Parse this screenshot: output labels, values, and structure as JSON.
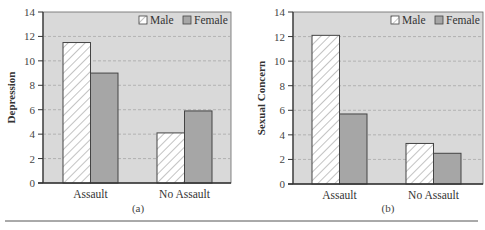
{
  "chart_data": [
    {
      "type": "bar",
      "panel": "(a)",
      "title": "",
      "xlabel": "",
      "ylabel": "Depression",
      "categories": [
        "Assault",
        "No Assault"
      ],
      "series": [
        {
          "name": "Male",
          "values": [
            11.5,
            4.1
          ],
          "pattern": "hatched",
          "color": "#ffffff"
        },
        {
          "name": "Female",
          "values": [
            9.0,
            5.9
          ],
          "pattern": "solid",
          "color": "#a6a6a6"
        }
      ],
      "ylim": [
        0,
        14
      ],
      "yticks": [
        0,
        2,
        4,
        6,
        8,
        10,
        12,
        14
      ],
      "grid": true,
      "legend_position": "top-right"
    },
    {
      "type": "bar",
      "panel": "(b)",
      "title": "",
      "xlabel": "",
      "ylabel": "Sexual Concern",
      "categories": [
        "Assault",
        "No Assault"
      ],
      "series": [
        {
          "name": "Male",
          "values": [
            12.1,
            3.3
          ],
          "pattern": "hatched",
          "color": "#ffffff"
        },
        {
          "name": "Female",
          "values": [
            5.7,
            2.5
          ],
          "pattern": "solid",
          "color": "#a6a6a6"
        }
      ],
      "ylim": [
        0,
        14
      ],
      "yticks": [
        0,
        2,
        4,
        6,
        8,
        10,
        12,
        14
      ],
      "grid": true,
      "legend_position": "top-right"
    }
  ],
  "colors": {
    "plot_bg": "#d9d9d9",
    "female_bar": "#a6a6a6",
    "male_bar": "#ffffff",
    "grid": "#a8a8a8",
    "axis": "#333333"
  },
  "panels": [
    {
      "caption": "(a)",
      "ylabel": "Depression",
      "legend": [
        "Male",
        "Female"
      ],
      "categories": [
        "Assault",
        "No Assault"
      ]
    },
    {
      "caption": "(b)",
      "ylabel": "Sexual Concern",
      "legend": [
        "Male",
        "Female"
      ],
      "categories": [
        "Assault",
        "No Assault"
      ]
    }
  ]
}
